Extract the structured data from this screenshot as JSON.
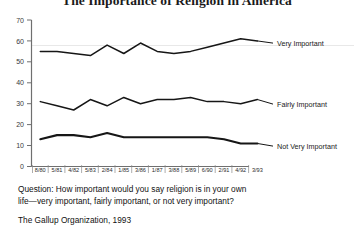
{
  "chart_data": {
    "type": "line",
    "title": "The Importance of Religion in America",
    "xlabel": "",
    "ylabel": "",
    "ylim": [
      0,
      70
    ],
    "yticks": [
      0,
      10,
      20,
      30,
      40,
      50,
      60,
      70
    ],
    "grid": false,
    "legend_position": "right-inline-labels",
    "x": [
      "8/80",
      "5/81",
      "4/82",
      "5/83",
      "2/84",
      "1/85",
      "3/86",
      "1/87",
      "3/88",
      "5/89",
      "6/90",
      "2/91",
      "4/92",
      "3/93"
    ],
    "series": [
      {
        "name": "Very Important",
        "values": [
          55,
          55,
          54,
          53,
          58,
          54,
          59,
          55,
          54,
          55,
          57,
          59,
          61,
          60
        ]
      },
      {
        "name": "Fairly Important",
        "values": [
          31,
          29,
          27,
          32,
          29,
          33,
          30,
          32,
          32,
          33,
          31,
          31,
          30,
          32
        ]
      },
      {
        "name": "Not Very Important",
        "values": [
          13,
          15,
          15,
          14,
          16,
          14,
          14,
          14,
          14,
          14,
          14,
          13,
          11,
          11
        ]
      }
    ],
    "annotations": {
      "question": "Question: How important would you say religion is in your own life—very important, fairly important, or not very important?",
      "question_line_1": "Question: How important would you say religion is in your own",
      "question_line_2": "life—very important, fairly important, or not very important?",
      "source": "The Gallup Organization, 1993"
    },
    "colors": {
      "line": "#161616",
      "axis": "#6f6f6f",
      "gridline": "#e8e8e8",
      "background": "#ffffff",
      "text": "#111111"
    }
  }
}
